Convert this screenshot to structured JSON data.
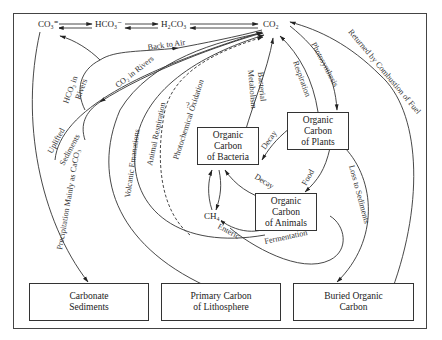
{
  "diagram": {
    "type": "carbon cycle",
    "top_species": {
      "co3": "CO₃⁼",
      "hco3": "HCO₃⁻",
      "h2co3": "H₂CO₃",
      "co2": "CO₂"
    },
    "nodes": {
      "bacteria": "Organic\nCarbon\nof Bacteria",
      "plants": "Organic\nCarbon\nof Plants",
      "animals": "Organic\nCarbon\nof Animals",
      "ch4": "CH₄",
      "carbonate": "Carbonate\nSediments",
      "lithosphere": "Primary Carbon\nof Lithosphere",
      "buried": "Buried Organic\nCarbon"
    },
    "flows": {
      "back_to_air": "Back to Air",
      "co2_in_rivers": "CO₂ in Rivers",
      "hco3_in_rivers_1": "HCO₃ in",
      "hco3_in_rivers_2": "Rivers",
      "uplifted_1": "Uplifted",
      "uplifted_2": "Sediments",
      "precipitation": "Precipitation Mainly as CaCO₃",
      "volcanic": "Volcanic Emanations",
      "animal_resp": "Animal Respiration",
      "photochem": "Photochemical Oxidation",
      "question": "?",
      "bacterial_1": "Bacterial",
      "bacterial_2": "Metabolism",
      "respiration": "Respiration",
      "photosynthesis": "Photosynthesis",
      "combustion": "Returned by Combustion of Fuel",
      "decay_plants": "Decay",
      "decay_animals": "Decay",
      "food": "Food",
      "loss_sediments": "Loss to Sediments",
      "enteric": "Enteric",
      "fermentation": "Fermentation"
    }
  }
}
